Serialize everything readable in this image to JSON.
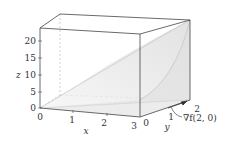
{
  "figure": {
    "type": "3d-surface-plot",
    "axes": {
      "x": {
        "label": "x",
        "ticks": [
          "0",
          "1",
          "2",
          "3"
        ]
      },
      "y": {
        "label": "y",
        "ticks": [
          "0",
          "1",
          "2"
        ]
      },
      "z": {
        "label": "z",
        "ticks": [
          "0",
          "5",
          "10",
          "15",
          "20"
        ]
      }
    },
    "annotation": "∇f(2, 0)",
    "colors": {
      "box": "#444444",
      "surface": "#e6e6e6",
      "dashed": "#9a9a9a"
    }
  }
}
